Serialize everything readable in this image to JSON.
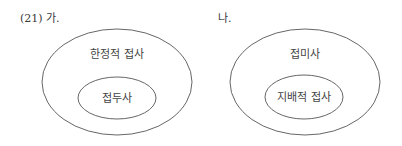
{
  "example_number": "(21) 가.",
  "diagrams": [
    {
      "label": "(21) 가.",
      "outer_label": "한정적 접사",
      "inner_label": "접두사"
    },
    {
      "label": "나.",
      "outer_label": "접미사",
      "inner_label": "지배적 접사"
    }
  ]
}
